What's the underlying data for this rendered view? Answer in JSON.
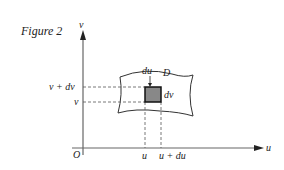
{
  "figure": {
    "title": "Figure 2"
  },
  "axes": {
    "x_label": "u",
    "y_label": "v",
    "origin_label": "O"
  },
  "region": {
    "label": "D",
    "fill_color": "#888888"
  },
  "ticks": {
    "x": [
      "u",
      "u + du"
    ],
    "y": [
      "v + dv",
      "v"
    ]
  },
  "element_labels": {
    "width": "du",
    "height": "dv"
  }
}
